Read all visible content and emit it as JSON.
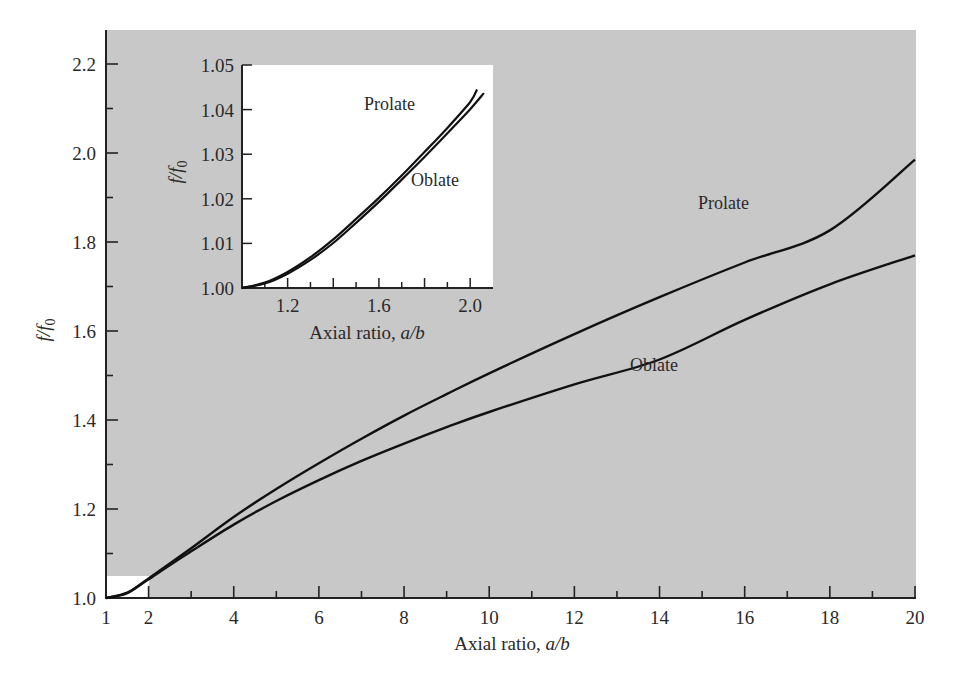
{
  "chart_data": [
    {
      "id": "main",
      "type": "line",
      "title": "",
      "xlabel": "Axial ratio, a/b",
      "ylabel": "f/f0",
      "xlim": [
        1,
        20
      ],
      "ylim": [
        1.0,
        2.27
      ],
      "x_ticks": [
        1,
        2,
        4,
        6,
        8,
        10,
        12,
        14,
        16,
        18,
        20
      ],
      "y_ticks": [
        "1.0",
        "1.2",
        "1.4",
        "1.6",
        "1.8",
        "2.0",
        "2.2"
      ],
      "grid": false,
      "background": "#c9c9c9",
      "highlight_region": {
        "x": [
          1,
          2
        ],
        "y": [
          1.0,
          1.05
        ],
        "color": "#ffffff"
      },
      "series": [
        {
          "name": "Prolate",
          "x": [
            1,
            1.5,
            2,
            3,
            4,
            5,
            6,
            7,
            8,
            9,
            10,
            12,
            14,
            16,
            18,
            20
          ],
          "values": [
            1.0,
            1.012,
            1.044,
            1.112,
            1.182,
            1.245,
            1.303,
            1.358,
            1.41,
            1.458,
            1.505,
            1.593,
            1.676,
            1.754,
            1.826,
            1.985
          ]
        },
        {
          "name": "Oblate",
          "x": [
            1,
            1.5,
            2,
            3,
            4,
            5,
            6,
            7,
            8,
            9,
            10,
            12,
            14,
            16,
            18,
            20
          ],
          "values": [
            1.0,
            1.011,
            1.042,
            1.105,
            1.165,
            1.218,
            1.265,
            1.308,
            1.347,
            1.384,
            1.418,
            1.48,
            1.536,
            1.625,
            1.705,
            1.77
          ]
        }
      ],
      "annotations": [
        {
          "text": "Prolate",
          "x": 16.4,
          "y": 1.94
        },
        {
          "text": "Oblate",
          "x": 13.7,
          "y": 1.52
        }
      ]
    },
    {
      "id": "inset",
      "type": "line",
      "xlabel": "Axial ratio, a/b",
      "ylabel": "f/f0",
      "xlim": [
        1.0,
        2.1
      ],
      "ylim": [
        1.0,
        1.05
      ],
      "x_ticks": [
        "1.2",
        "1.6",
        "2.0"
      ],
      "y_ticks": [
        "1.00",
        "1.01",
        "1.02",
        "1.03",
        "1.04",
        "1.05"
      ],
      "grid": false,
      "background": "#ffffff",
      "series": [
        {
          "name": "Prolate",
          "x": [
            1.0,
            1.1,
            1.2,
            1.3,
            1.4,
            1.5,
            1.6,
            1.7,
            1.8,
            1.9,
            2.0,
            2.03
          ],
          "values": [
            1.0,
            1.0012,
            1.0036,
            1.0069,
            1.0109,
            1.0155,
            1.0202,
            1.0252,
            1.0305,
            1.0359,
            1.0417,
            1.0445
          ]
        },
        {
          "name": "Oblate",
          "x": [
            1.0,
            1.1,
            1.2,
            1.3,
            1.4,
            1.5,
            1.6,
            1.7,
            1.8,
            1.9,
            2.0,
            2.06
          ],
          "values": [
            1.0,
            1.001,
            1.0032,
            1.0063,
            1.0101,
            1.0146,
            1.0193,
            1.0243,
            1.0294,
            1.0347,
            1.0401,
            1.0437
          ]
        }
      ],
      "annotations": [
        {
          "text": "Prolate",
          "x": 1.55,
          "y": 1.041
        },
        {
          "text": "Oblate",
          "x": 1.73,
          "y": 1.024
        }
      ]
    }
  ],
  "labels": {
    "main_xlabel_text": "Axial ratio, ",
    "main_xlabel_var": "a/b",
    "main_ylabel_f": "f",
    "main_ylabel_slash": "/",
    "main_ylabel_f0": "f",
    "main_ylabel_sub": "0",
    "inset_xlabel_text": "Axial ratio, ",
    "inset_xlabel_var": "a/b",
    "prolate": "Prolate",
    "oblate": "Oblate"
  }
}
